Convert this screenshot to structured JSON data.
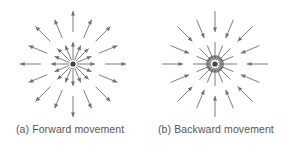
{
  "figure": {
    "panels": [
      {
        "id": "a",
        "caption": "(a) Forward movement",
        "direction": "outward",
        "center": [
          73,
          64
        ],
        "arrow_count": 16
      },
      {
        "id": "b",
        "caption": "(b) Backward movement",
        "direction": "inward",
        "center": [
          215,
          64
        ],
        "arrow_count": 16
      }
    ],
    "colors": {
      "arrow": "#6e6e6e",
      "center_dot": "#444444",
      "caption": "#555555",
      "background": "#ffffff"
    }
  }
}
